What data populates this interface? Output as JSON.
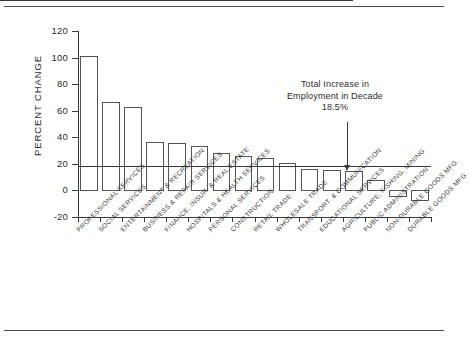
{
  "chart_data": {
    "type": "bar",
    "title": "",
    "xlabel": "",
    "ylabel": "PERCENT CHANGE",
    "ylim": [
      -20,
      120
    ],
    "yticks": [
      -20,
      0,
      20,
      40,
      60,
      80,
      100,
      120
    ],
    "ytick_labels": [
      "-20",
      "0",
      "20",
      "40",
      "60",
      "80",
      "100",
      "120"
    ],
    "grid": false,
    "legend": "none",
    "categories": [
      "PROFESSIONAL SERVICES",
      "SOCIAL SERVICES",
      "ENTERTAINMENT & RECREATION",
      "BUSINESS & REPAIR SERVICES",
      "FINANCE, INSUR. & REAL ESTATE",
      "HOSPITALS & HEALTH SERVICES",
      "PERSONAL SERVICES",
      "CONSTRUCTION",
      "RETAIL TRADE",
      "WHOLESALE TRADE",
      "TRANSPORT. & COMMUNICATION",
      "EDUCATIONAL SERVICES",
      "AGRICULTURE, FISHING, MINING",
      "PUBLIC ADMINISTRATION",
      "NON-DURABLE GOODS MFG.",
      "DURABLE GOODS MFG."
    ],
    "values": [
      101,
      66.5,
      62.5,
      36.5,
      35.5,
      33.5,
      28.5,
      26,
      24.5,
      20.5,
      16.5,
      15.5,
      14.5,
      8,
      -4,
      -7
    ],
    "reference_line": {
      "value": 18.5,
      "label_lines": [
        "Total Increase in",
        "Employment in Decade",
        "18.5%"
      ]
    }
  },
  "annotation": {
    "line1": "Total Increase in",
    "line2": "Employment in Decade",
    "line3": "18.5%"
  },
  "axes": {
    "y_title": "PERCENT CHANGE"
  }
}
